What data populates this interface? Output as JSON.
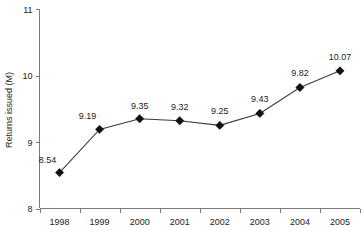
{
  "chart_data": {
    "type": "line",
    "title": "",
    "xlabel": "",
    "ylabel": "Returns issued (M)",
    "categories": [
      "1998",
      "1999",
      "2000",
      "2001",
      "2002",
      "2003",
      "2004",
      "2005"
    ],
    "values": [
      8.54,
      9.19,
      9.35,
      9.32,
      9.25,
      9.43,
      9.82,
      10.07
    ],
    "data_labels": [
      "8.54",
      "9.19",
      "9.35",
      "9.32",
      "9.25",
      "9.43",
      "9.82",
      "10.07"
    ],
    "ylim": [
      8,
      11
    ],
    "yticks": [
      8,
      9,
      10,
      11
    ],
    "ytick_labels": [
      "8",
      "9",
      "10",
      "11"
    ],
    "xtick_labels": [
      "1998",
      "1999",
      "2000",
      "2001",
      "2002",
      "2003",
      "2004",
      "2005"
    ],
    "grid": false,
    "legend": null,
    "legend_position": "none",
    "series": [
      {
        "name": "Returns issued (M)",
        "values": [
          8.54,
          9.19,
          9.35,
          9.32,
          9.25,
          9.43,
          9.82,
          10.07
        ],
        "marker": "diamond",
        "marker_color": "#111111",
        "line_color": "#3b3b3b"
      }
    ],
    "label_offsets": [
      {
        "dx": -12,
        "dy": -10
      },
      {
        "dx": -12,
        "dy": -10
      },
      {
        "dx": 0,
        "dy": -10
      },
      {
        "dx": 0,
        "dy": -11
      },
      {
        "dx": 0,
        "dy": -11
      },
      {
        "dx": 0,
        "dy": -11
      },
      {
        "dx": 0,
        "dy": -11
      },
      {
        "dx": 0,
        "dy": -11
      }
    ]
  },
  "colors": {
    "background": "#ffffff",
    "axis": "#7a7a7a",
    "line": "#3b3b3b",
    "marker": "#111111",
    "text": "#1c1c1c"
  }
}
